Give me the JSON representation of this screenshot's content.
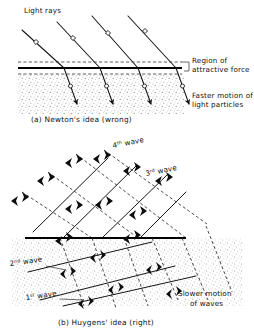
{
  "figure": {
    "background_color": "#ffffff",
    "ink_color": "#111111",
    "stipple_color": "#8a8a8a"
  },
  "panel_a": {
    "caption": "(a) Newton's idea (wrong)",
    "labels": {
      "light_rays": "Light rays",
      "region_line1": "Region of",
      "region_line2": "attractive force",
      "faster_line1": "Faster motion of",
      "faster_line2": "light particles"
    },
    "ray_marker_incident": "open-square",
    "ray_marker_refracted": "open-circle",
    "ray_count": 4,
    "interface": {
      "solid_y": 68,
      "dashed_above_y": 62,
      "dashed_below_y": 74,
      "x_start": 18,
      "x_end": 168
    }
  },
  "panel_b": {
    "caption": "(b) Huygens' idea (right)",
    "labels": {
      "wave4_num": "4",
      "wave4_sup": "th",
      "wave4_word": "wave",
      "wave3_num": "3",
      "wave3_sup": "rd",
      "wave3_word": "wave",
      "wave2_num": "2",
      "wave2_sup": "nd",
      "wave2_word": "wave",
      "wave1_num": "1",
      "wave1_sup": "st",
      "wave1_word": "wave",
      "slower_line1": "Slower motion",
      "slower_line2": "of waves"
    },
    "wavefront_count": 4,
    "interface": {
      "y": 238,
      "x_start": 25,
      "x_end": 186
    }
  }
}
